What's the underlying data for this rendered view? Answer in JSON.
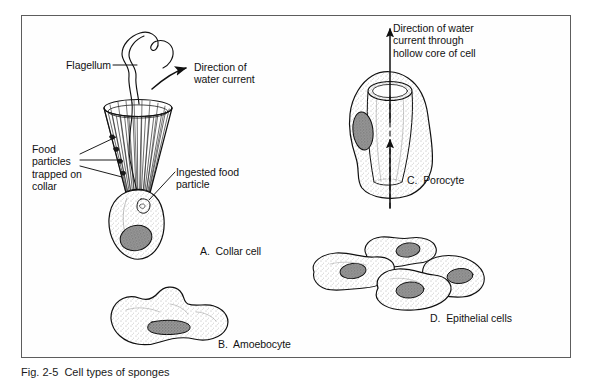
{
  "figure": {
    "caption": "Fig. 2-5  Cell types of sponges",
    "frame": {
      "border_color": "#5d5d5d",
      "background": "#fefefe"
    },
    "ink_color": "#101010",
    "nucleus_fill": "#8a8a8a"
  },
  "labels": {
    "flagellum": "Flagellum",
    "direction_water_current": "Direction of\nwater current",
    "food_particles_trapped": "Food\nparticles\ntrapped on\ncollar",
    "ingested_food_particle": "Ingested food\nparticle",
    "collar_cell": "A.  Collar cell",
    "amoebocyte": "B.  Amoebocyte",
    "direction_water_core": "Direction of water\ncurrent through\nhollow core of cell",
    "porocyte": "C.  Porocyte",
    "epithelial_cells": "D.  Epithelial cells"
  },
  "panels": [
    {
      "id": "A",
      "name": "Collar cell",
      "features": [
        "flagellum",
        "collar",
        "food particles trapped on collar",
        "ingested food particle",
        "nucleus"
      ]
    },
    {
      "id": "B",
      "name": "Amoebocyte",
      "features": [
        "pseudopodia",
        "nucleus"
      ]
    },
    {
      "id": "C",
      "name": "Porocyte",
      "features": [
        "hollow core",
        "water current arrow",
        "nucleus"
      ]
    },
    {
      "id": "D",
      "name": "Epithelial cells",
      "features": [
        "four flattened cells",
        "nucleus each"
      ]
    }
  ]
}
